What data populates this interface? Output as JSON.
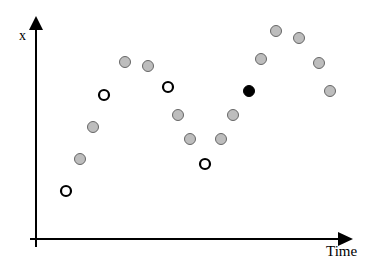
{
  "axes": {
    "y_label": "x",
    "x_label": "Time",
    "color": "#000000"
  },
  "marker_styles": {
    "gray": {
      "fill": "#bdbdbd",
      "stroke": "#666666",
      "stroke_width": 1,
      "r": 5.5
    },
    "open": {
      "fill": "#ffffff",
      "stroke": "#000000",
      "stroke_width": 2.2,
      "r": 5
    },
    "black": {
      "fill": "#000000",
      "stroke": "#000000",
      "stroke_width": 1,
      "r": 5.5
    }
  },
  "chart_data": {
    "type": "scatter",
    "title": "",
    "xlabel": "Time",
    "ylabel": "x",
    "grid": false,
    "legend": null,
    "note": "Wave-like time series of sampled points; marker style distinguishes point categories (gray filled, open circle, solid black). Coordinates are pixel positions in a 376x267 canvas.",
    "points": [
      {
        "x": 66,
        "y": 191,
        "style": "open"
      },
      {
        "x": 80,
        "y": 159,
        "style": "gray"
      },
      {
        "x": 93,
        "y": 127,
        "style": "gray"
      },
      {
        "x": 104,
        "y": 95,
        "style": "open"
      },
      {
        "x": 125,
        "y": 62,
        "style": "gray"
      },
      {
        "x": 148,
        "y": 66,
        "style": "gray"
      },
      {
        "x": 168,
        "y": 87,
        "style": "open"
      },
      {
        "x": 178,
        "y": 115,
        "style": "gray"
      },
      {
        "x": 190,
        "y": 139,
        "style": "gray"
      },
      {
        "x": 205,
        "y": 164,
        "style": "open"
      },
      {
        "x": 221,
        "y": 139,
        "style": "gray"
      },
      {
        "x": 233,
        "y": 115,
        "style": "gray"
      },
      {
        "x": 249,
        "y": 91,
        "style": "black"
      },
      {
        "x": 261,
        "y": 59,
        "style": "gray"
      },
      {
        "x": 276,
        "y": 31,
        "style": "gray"
      },
      {
        "x": 299,
        "y": 38,
        "style": "gray"
      },
      {
        "x": 319,
        "y": 63,
        "style": "gray"
      },
      {
        "x": 330,
        "y": 91,
        "style": "gray"
      }
    ]
  }
}
